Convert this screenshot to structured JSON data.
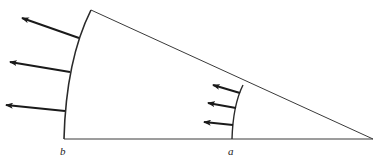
{
  "diagram": {
    "colors": {
      "line": "#3a3a3a",
      "arrow": "#1a1a1a",
      "background": "#ffffff"
    },
    "geometry": {
      "apex": [
        373,
        139
      ],
      "outer_arc_bottom": [
        64,
        139
      ],
      "outer_arc_top": [
        91,
        10
      ],
      "inner_arc_bottom": [
        232,
        139
      ],
      "inner_arc_top": [
        243,
        85
      ]
    },
    "labels": [
      {
        "id": "b",
        "text": "b",
        "x": 60,
        "y": 145
      },
      {
        "id": "a",
        "text": "a",
        "x": 228,
        "y": 145
      }
    ],
    "outer_arrows": [
      {
        "from": [
          79,
          38
        ],
        "to": [
          22,
          18
        ]
      },
      {
        "from": [
          70,
          72
        ],
        "to": [
          10,
          62
        ]
      },
      {
        "from": [
          65,
          111
        ],
        "to": [
          6,
          105
        ]
      }
    ],
    "inner_arrows": [
      {
        "from": [
          240,
          93
        ],
        "to": [
          213,
          85
        ]
      },
      {
        "from": [
          236,
          108
        ],
        "to": [
          208,
          103
        ]
      },
      {
        "from": [
          233,
          125
        ],
        "to": [
          204,
          122
        ]
      }
    ]
  }
}
